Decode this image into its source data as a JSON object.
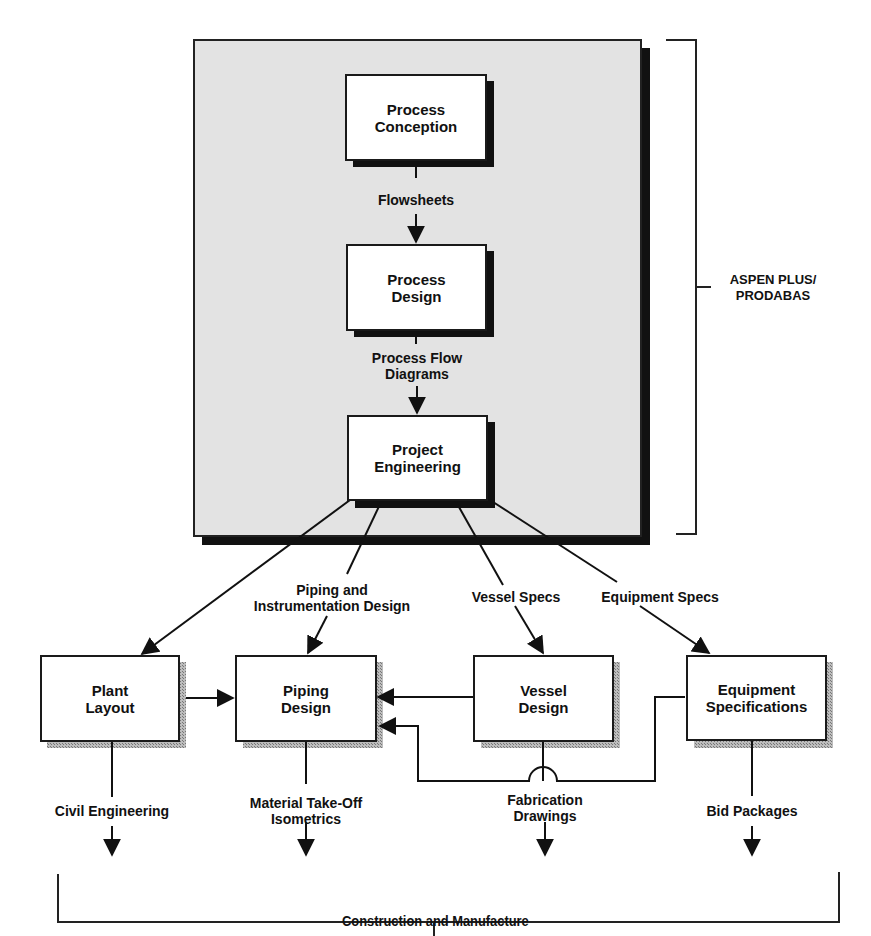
{
  "diagram": {
    "group": {
      "label": "ASPEN PLUS/\nPRODABAS",
      "background": "#e3e3e3",
      "shadow": "#111111"
    },
    "nodes": {
      "process_conception": "Process\nConception",
      "process_design": "Process\nDesign",
      "project_engineering": "Project\nEngineering",
      "plant_layout": "Plant\nLayout",
      "piping_design": "Piping\nDesign",
      "vessel_design": "Vessel\nDesign",
      "equipment_specifications": "Equipment\nSpecifications"
    },
    "edge_labels": {
      "flowsheets": "Flowsheets",
      "process_flow_diagrams": "Process Flow\nDiagrams",
      "pid": "Piping and\nInstrumentation Design",
      "vessel_specs": "Vessel Specs",
      "equipment_specs": "Equipment Specs",
      "civil_engineering": "Civil Engineering",
      "material_takeoff": "Material  Take-Off\nIsometrics",
      "fabrication_drawings": "Fabrication\nDrawings",
      "bid_packages": "Bid Packages"
    },
    "output": {
      "label": "Construction and Manufacture"
    }
  }
}
